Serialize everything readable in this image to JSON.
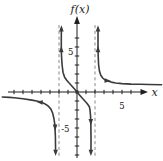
{
  "figure": {
    "ylabel": "f(x)",
    "xlabel": "x",
    "y_tick_pos_label": "5",
    "y_tick_neg_label": "-5",
    "x_tick_label": "5"
  },
  "chart_data": {
    "type": "line",
    "title": "",
    "xlabel": "x",
    "ylabel": "f(x)",
    "xlim": [
      -8.5,
      9.5
    ],
    "ylim": [
      -7.5,
      8.5
    ],
    "grid": false,
    "x_ticks": [
      -7,
      -6,
      -5,
      -4,
      -3,
      -2,
      -1,
      1,
      2,
      3,
      4,
      5,
      6
    ],
    "y_ticks": [
      -7,
      -6,
      -5,
      -4,
      -3,
      -2,
      -1,
      1,
      2,
      3,
      4,
      5,
      6
    ],
    "labeled_ticks": {
      "x": [
        5
      ],
      "y": [
        5,
        -5
      ]
    },
    "vertical_asymptotes": [
      -2,
      2
    ],
    "asymptote_style": "dashed",
    "origin_point": [
      0,
      0
    ],
    "series": [
      {
        "name": "branch-left",
        "points": [
          [
            -8.3,
            -0.55
          ],
          [
            -7.5,
            -0.6
          ],
          [
            -7,
            -0.65
          ],
          [
            -6,
            -0.75
          ],
          [
            -5,
            -0.9
          ],
          [
            -4.5,
            -1.0
          ],
          [
            -4,
            -1.12
          ],
          [
            -3.6,
            -1.3
          ],
          [
            -3.2,
            -1.55
          ],
          [
            -2.9,
            -1.9
          ],
          [
            -2.7,
            -2.35
          ],
          [
            -2.55,
            -3.0
          ],
          [
            -2.47,
            -3.6
          ],
          [
            -2.43,
            -4.2
          ],
          [
            -2.4,
            -5.0
          ],
          [
            -2.39,
            -5.8
          ],
          [
            -2.38,
            -6.75
          ]
        ]
      },
      {
        "name": "branch-middle",
        "points": [
          [
            -1.73,
            7.05
          ],
          [
            -1.74,
            6.0
          ],
          [
            -1.74,
            5.0
          ],
          [
            -1.72,
            4.0
          ],
          [
            -1.66,
            3.0
          ],
          [
            -1.55,
            2.2
          ],
          [
            -1.38,
            1.65
          ],
          [
            -1.15,
            1.3
          ],
          [
            -0.9,
            1.02
          ],
          [
            -0.6,
            0.7
          ],
          [
            -0.3,
            0.36
          ],
          [
            0,
            0
          ],
          [
            0.3,
            -0.36
          ],
          [
            0.6,
            -0.7
          ],
          [
            0.9,
            -1.02
          ],
          [
            1.15,
            -1.3
          ],
          [
            1.38,
            -1.65
          ],
          [
            1.45,
            -2.0
          ],
          [
            1.5,
            -2.6
          ],
          [
            1.53,
            -3.3
          ],
          [
            1.54,
            -4.0
          ],
          [
            1.55,
            -5.0
          ],
          [
            1.55,
            -6.0
          ],
          [
            1.54,
            -6.75
          ]
        ]
      },
      {
        "name": "branch-right",
        "points": [
          [
            2.33,
            7.05
          ],
          [
            2.33,
            6.0
          ],
          [
            2.33,
            5.0
          ],
          [
            2.35,
            4.0
          ],
          [
            2.4,
            3.0
          ],
          [
            2.5,
            2.3
          ],
          [
            2.65,
            1.85
          ],
          [
            2.85,
            1.55
          ],
          [
            3.1,
            1.35
          ],
          [
            3.4,
            1.22
          ],
          [
            3.8,
            1.1
          ],
          [
            4.3,
            1.0
          ],
          [
            5,
            0.93
          ],
          [
            6,
            0.88
          ],
          [
            7,
            0.85
          ],
          [
            8,
            0.83
          ],
          [
            9.4,
            0.8
          ]
        ]
      }
    ],
    "curve_arrows": [
      {
        "x": -1.735,
        "y": 7.0,
        "dir": "up"
      },
      {
        "x": 2.33,
        "y": 7.0,
        "dir": "up"
      },
      {
        "x": -2.38,
        "y": -6.7,
        "dir": "down"
      },
      {
        "x": 1.54,
        "y": -6.7,
        "dir": "down"
      },
      {
        "x": -1.74,
        "y": 4.7,
        "dir": "up"
      },
      {
        "x": 2.33,
        "y": 4.7,
        "dir": "up"
      },
      {
        "x": -2.43,
        "y": -3.9,
        "dir": "down"
      },
      {
        "x": 1.53,
        "y": -3.3,
        "dir": "down"
      },
      {
        "x": -4.1,
        "y": -1.13,
        "dir": "left"
      },
      {
        "x": 3.35,
        "y": 1.26,
        "dir": "right"
      }
    ]
  },
  "style": {
    "curve_color": "#3b3b3b",
    "axis_color": "#1f1f1f",
    "asymptote_color": "#8a8a8a",
    "label_color": "#111111",
    "background": "#ffffff"
  }
}
